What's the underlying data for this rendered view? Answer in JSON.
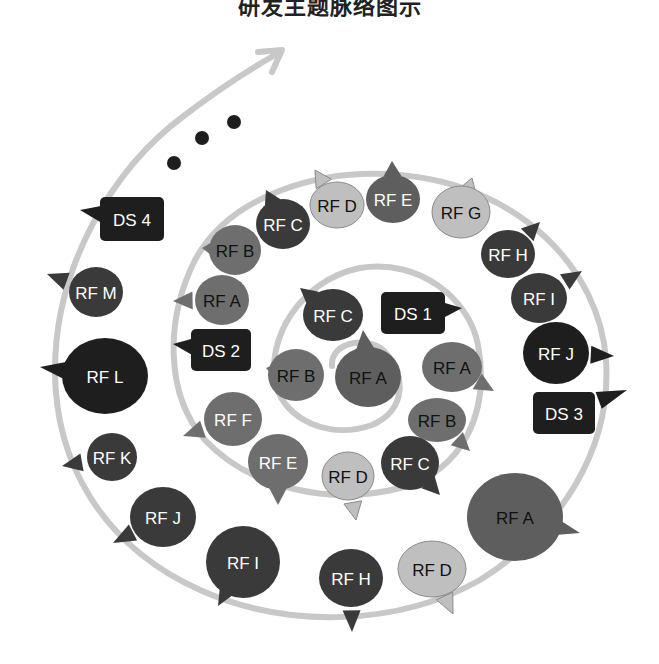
{
  "title": "研发主题脉络图示",
  "colors": {
    "spiral": "#c8c8c8",
    "dark": "#3a3a3a",
    "black": "#1e1e1e",
    "mid": "#5e5e5e",
    "gray": "#6e6e6e",
    "light": "#bfbfbf",
    "text_light": "#ffffff",
    "text_dark": "#111111"
  },
  "continuation_dots": 3,
  "rings": {
    "inner": [
      {
        "label": "RF A",
        "x": 368,
        "y": 377,
        "rx": 33,
        "ry": 30,
        "fill": "mid",
        "text": "dark",
        "tail": [
          363,
          330
        ],
        "shape": "ellipse"
      },
      {
        "label": "RF C",
        "x": 333,
        "y": 315,
        "rx": 30,
        "ry": 26,
        "fill": "dark",
        "text": "light",
        "tail": [
          300,
          288
        ],
        "shape": "ellipse"
      },
      {
        "label": "DS 1",
        "x": 413,
        "y": 313,
        "w": 64,
        "h": 42,
        "fill": "black",
        "text": "light",
        "tail": [
          462,
          308
        ],
        "shape": "rect"
      },
      {
        "label": "RF B",
        "x": 296,
        "y": 375,
        "rx": 28,
        "ry": 26,
        "fill": "gray",
        "text": "dark",
        "tail": [
          266,
          368
        ],
        "shape": "ellipse"
      },
      {
        "label": "RF A",
        "x": 452,
        "y": 367,
        "rx": 30,
        "ry": 25,
        "fill": "gray",
        "text": "dark",
        "tail": [
          494,
          391
        ],
        "shape": "ellipse"
      },
      {
        "label": "RF B",
        "x": 437,
        "y": 420,
        "rx": 29,
        "ry": 22,
        "fill": "gray",
        "text": "dark",
        "tail": [
          470,
          451
        ],
        "shape": "ellipse"
      }
    ],
    "middle": [
      {
        "label": "RF C",
        "x": 410,
        "y": 463,
        "rx": 29,
        "ry": 27,
        "fill": "dark",
        "text": "light",
        "tail": [
          440,
          495
        ],
        "shape": "ellipse"
      },
      {
        "label": "RF D",
        "x": 348,
        "y": 476,
        "rx": 26,
        "ry": 24,
        "fill": "light",
        "text": "dark",
        "tail": [
          356,
          520
        ],
        "shape": "ellipse"
      },
      {
        "label": "RF E",
        "x": 278,
        "y": 462,
        "rx": 30,
        "ry": 28,
        "fill": "gray",
        "text": "light",
        "tail": [
          278,
          505
        ],
        "shape": "ellipse"
      },
      {
        "label": "RF F",
        "x": 233,
        "y": 419,
        "rx": 29,
        "ry": 27,
        "fill": "gray",
        "text": "light",
        "tail": [
          183,
          436
        ],
        "shape": "ellipse"
      },
      {
        "label": "DS 2",
        "x": 221,
        "y": 350,
        "w": 60,
        "h": 42,
        "fill": "black",
        "text": "light",
        "tail": [
          173,
          344
        ],
        "shape": "rect"
      },
      {
        "label": "RF A",
        "x": 222,
        "y": 300,
        "rx": 27,
        "ry": 25,
        "fill": "gray",
        "text": "dark",
        "tail": [
          173,
          301
        ],
        "shape": "ellipse"
      },
      {
        "label": "RF B",
        "x": 235,
        "y": 250,
        "rx": 26,
        "ry": 25,
        "fill": "gray",
        "text": "dark",
        "tail": [
          202,
          248
        ],
        "shape": "ellipse"
      },
      {
        "label": "RF C",
        "x": 283,
        "y": 224,
        "rx": 27,
        "ry": 25,
        "fill": "dark",
        "text": "light",
        "tail": [
          266,
          190
        ],
        "shape": "ellipse"
      },
      {
        "label": "RF D",
        "x": 337,
        "y": 205,
        "rx": 27,
        "ry": 23,
        "fill": "light",
        "text": "dark",
        "tail": [
          315,
          170
        ],
        "shape": "ellipse"
      },
      {
        "label": "RF E",
        "x": 393,
        "y": 199,
        "rx": 27,
        "ry": 24,
        "fill": "mid",
        "text": "light",
        "tail": [
          392,
          161
        ],
        "shape": "ellipse"
      },
      {
        "label": "RF G",
        "x": 461,
        "y": 212,
        "rx": 29,
        "ry": 26,
        "fill": "light",
        "text": "dark",
        "tail": [
          472,
          178
        ],
        "shape": "ellipse"
      },
      {
        "label": "RF H",
        "x": 508,
        "y": 254,
        "rx": 27,
        "ry": 24,
        "fill": "dark",
        "text": "light",
        "tail": [
          540,
          222
        ],
        "shape": "ellipse"
      },
      {
        "label": "RF I",
        "x": 539,
        "y": 298,
        "rx": 28,
        "ry": 25,
        "fill": "dark",
        "text": "light",
        "tail": [
          582,
          271
        ],
        "shape": "ellipse"
      },
      {
        "label": "RF J",
        "x": 556,
        "y": 353,
        "rx": 33,
        "ry": 31,
        "fill": "black",
        "text": "light",
        "tail": [
          614,
          356
        ],
        "shape": "ellipse"
      },
      {
        "label": "DS 3",
        "x": 564,
        "y": 413,
        "w": 62,
        "h": 42,
        "fill": "black",
        "text": "light",
        "tail": [
          627,
          390
        ],
        "shape": "rect"
      }
    ],
    "outer": [
      {
        "label": "RF A",
        "x": 515,
        "y": 517,
        "rx": 48,
        "ry": 44,
        "fill": "mid",
        "text": "dark",
        "tail": [
          580,
          533
        ],
        "shape": "ellipse"
      },
      {
        "label": "RF D",
        "x": 432,
        "y": 569,
        "rx": 34,
        "ry": 28,
        "fill": "light",
        "text": "dark",
        "tail": [
          453,
          614
        ],
        "shape": "ellipse"
      },
      {
        "label": "RF H",
        "x": 351,
        "y": 578,
        "rx": 32,
        "ry": 29,
        "fill": "dark",
        "text": "light",
        "tail": [
          352,
          632
        ],
        "shape": "ellipse"
      },
      {
        "label": "RF I",
        "x": 243,
        "y": 562,
        "rx": 37,
        "ry": 36,
        "fill": "dark",
        "text": "light",
        "tail": [
          218,
          606
        ],
        "shape": "ellipse"
      },
      {
        "label": "RF J",
        "x": 163,
        "y": 517,
        "rx": 33,
        "ry": 30,
        "fill": "dark",
        "text": "light",
        "tail": [
          113,
          543
        ],
        "shape": "ellipse"
      },
      {
        "label": "RF K",
        "x": 112,
        "y": 457,
        "rx": 25,
        "ry": 24,
        "fill": "dark",
        "text": "light",
        "tail": [
          62,
          466
        ],
        "shape": "ellipse"
      },
      {
        "label": "RF L",
        "x": 105,
        "y": 376,
        "rx": 43,
        "ry": 38,
        "fill": "black",
        "text": "light",
        "tail": [
          40,
          367
        ],
        "shape": "ellipse"
      },
      {
        "label": "RF M",
        "x": 96,
        "y": 292,
        "rx": 27,
        "ry": 25,
        "fill": "dark",
        "text": "light",
        "tail": [
          47,
          274
        ],
        "shape": "ellipse"
      },
      {
        "label": "DS 4",
        "x": 132,
        "y": 219,
        "w": 64,
        "h": 44,
        "fill": "black",
        "text": "light",
        "tail": [
          80,
          210
        ],
        "shape": "rect"
      }
    ]
  }
}
